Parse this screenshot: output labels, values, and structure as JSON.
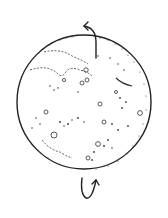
{
  "illustration": {
    "subject": "rotating planet with craters",
    "colors": {
      "ink": "#222222",
      "background": "#ffffff"
    },
    "sphere": {
      "cx": 84,
      "cy": 102,
      "r": 67
    },
    "top_arrow": {
      "direction": "counter-clockwise",
      "position": "top"
    },
    "bottom_arrow": {
      "direction": "upward-curve",
      "position": "bottom"
    }
  }
}
